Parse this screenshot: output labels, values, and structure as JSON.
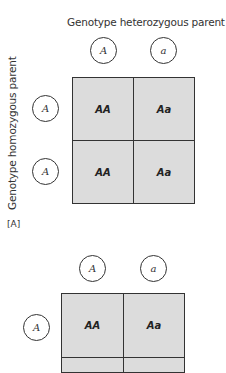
{
  "panel_a": {
    "column_title": "Genotype heterozygous parent",
    "row_title": "Genotype homozygous parent",
    "column_alleles": [
      "A",
      "a"
    ],
    "row_alleles": [
      "A",
      "A"
    ],
    "cells": [
      [
        "AA",
        "Aa"
      ],
      [
        "AA",
        "Aa"
      ]
    ],
    "label": "[A]"
  },
  "panel_b": {
    "column_alleles": [
      "A",
      "a"
    ],
    "row_alleles": [
      "A"
    ],
    "cells": [
      [
        "AA",
        "Aa"
      ]
    ]
  },
  "colors": {
    "cell_fill": "#dcdcdc",
    "line": "#333333",
    "background": "#ffffff"
  }
}
